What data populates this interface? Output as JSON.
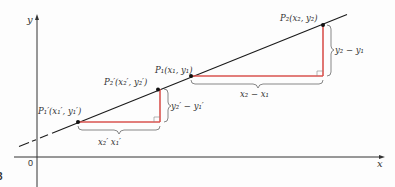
{
  "figure": {
    "number_label": "3",
    "axes": {
      "x_label": "x",
      "y_label": "y",
      "origin_label": "0"
    },
    "points": {
      "P1_prime": "P₁′(x₁′, y₁′)",
      "P2_prime": "P₂′(x₂′, y₂′)",
      "P1": "P₁(x₁, y₁)",
      "P2": "P₂(x₂, y₂)"
    },
    "braces": {
      "small_run": "x₂′   x₁′",
      "small_rise": "y₂′ − y₁′",
      "large_run": "x₂ − x₁",
      "large_rise": "y₂ − y₁"
    },
    "colors": {
      "line": "#1a1a1a",
      "triangle": "#d9534f",
      "axis": "#333333",
      "brace": "#555555"
    }
  }
}
